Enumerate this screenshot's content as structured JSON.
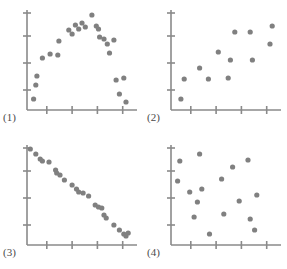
{
  "figure": {
    "width": 287,
    "height": 269,
    "background_color": "#ffffff",
    "axis_color": "#8a8a8a",
    "point_color": "#808080",
    "label_color": "#4a4a4a",
    "point_radius": 2.6
  },
  "chart_data": [
    {
      "type": "scatter",
      "title": "(1)",
      "panel_index": 1,
      "pattern": "curvilinear (inverted U)",
      "xlabel": "",
      "ylabel": "",
      "xlim": [
        0,
        100
      ],
      "ylim": [
        0,
        100
      ],
      "grid": false,
      "legend": "none",
      "x_ticks": [
        18,
        41,
        64,
        87
      ],
      "y_ticks": [
        20,
        47,
        74,
        97
      ],
      "x_tick_labels": [
        "",
        "",
        "",
        ""
      ],
      "y_tick_labels": [
        "",
        "",
        "",
        ""
      ],
      "points": [
        {
          "x": 6,
          "y": 11
        },
        {
          "x": 8,
          "y": 25
        },
        {
          "x": 9,
          "y": 34
        },
        {
          "x": 14,
          "y": 52
        },
        {
          "x": 21,
          "y": 56
        },
        {
          "x": 28,
          "y": 55
        },
        {
          "x": 29,
          "y": 69
        },
        {
          "x": 38,
          "y": 80
        },
        {
          "x": 41,
          "y": 76
        },
        {
          "x": 44,
          "y": 85
        },
        {
          "x": 47,
          "y": 81
        },
        {
          "x": 50,
          "y": 87
        },
        {
          "x": 53,
          "y": 83
        },
        {
          "x": 59,
          "y": 95
        },
        {
          "x": 63,
          "y": 84
        },
        {
          "x": 65,
          "y": 81
        },
        {
          "x": 66,
          "y": 73
        },
        {
          "x": 70,
          "y": 71
        },
        {
          "x": 73,
          "y": 66
        },
        {
          "x": 75,
          "y": 57
        },
        {
          "x": 79,
          "y": 70
        },
        {
          "x": 81,
          "y": 30
        },
        {
          "x": 84,
          "y": 16
        },
        {
          "x": 88,
          "y": 32
        },
        {
          "x": 90,
          "y": 8
        }
      ]
    },
    {
      "type": "scatter",
      "title": "(2)",
      "panel_index": 2,
      "pattern": "positive correlation",
      "xlabel": "",
      "ylabel": "",
      "xlim": [
        0,
        100
      ],
      "ylim": [
        0,
        100
      ],
      "grid": false,
      "legend": "none",
      "x_ticks": [
        18,
        41,
        64,
        87
      ],
      "y_ticks": [
        20,
        47,
        74,
        97
      ],
      "x_tick_labels": [
        "",
        "",
        "",
        ""
      ],
      "y_tick_labels": [
        "",
        "",
        "",
        ""
      ],
      "points": [
        {
          "x": 9,
          "y": 11
        },
        {
          "x": 12,
          "y": 31
        },
        {
          "x": 26,
          "y": 42
        },
        {
          "x": 34,
          "y": 31
        },
        {
          "x": 43,
          "y": 58
        },
        {
          "x": 52,
          "y": 32
        },
        {
          "x": 54,
          "y": 50
        },
        {
          "x": 58,
          "y": 78
        },
        {
          "x": 72,
          "y": 78
        },
        {
          "x": 74,
          "y": 50
        },
        {
          "x": 90,
          "y": 66
        },
        {
          "x": 92,
          "y": 84
        }
      ]
    },
    {
      "type": "scatter",
      "title": "(3)",
      "panel_index": 3,
      "pattern": "strong negative correlation",
      "xlabel": "",
      "ylabel": "",
      "xlim": [
        0,
        100
      ],
      "ylim": [
        0,
        100
      ],
      "grid": false,
      "legend": "none",
      "x_ticks": [
        18,
        41,
        64,
        87
      ],
      "y_ticks": [
        20,
        47,
        74,
        97
      ],
      "x_tick_labels": [
        "",
        "",
        "",
        ""
      ],
      "y_tick_labels": [
        "",
        "",
        "",
        ""
      ],
      "points": [
        {
          "x": 3,
          "y": 96
        },
        {
          "x": 8,
          "y": 91
        },
        {
          "x": 12,
          "y": 86
        },
        {
          "x": 14,
          "y": 84
        },
        {
          "x": 20,
          "y": 83
        },
        {
          "x": 26,
          "y": 75
        },
        {
          "x": 27,
          "y": 72
        },
        {
          "x": 30,
          "y": 70
        },
        {
          "x": 34,
          "y": 65
        },
        {
          "x": 41,
          "y": 60
        },
        {
          "x": 45,
          "y": 56
        },
        {
          "x": 47,
          "y": 53
        },
        {
          "x": 51,
          "y": 52
        },
        {
          "x": 56,
          "y": 49
        },
        {
          "x": 62,
          "y": 40
        },
        {
          "x": 65,
          "y": 38
        },
        {
          "x": 68,
          "y": 37
        },
        {
          "x": 70,
          "y": 30
        },
        {
          "x": 72,
          "y": 27
        },
        {
          "x": 79,
          "y": 20
        },
        {
          "x": 84,
          "y": 15
        },
        {
          "x": 88,
          "y": 11
        },
        {
          "x": 90,
          "y": 9
        },
        {
          "x": 92,
          "y": 12
        }
      ]
    },
    {
      "type": "scatter",
      "title": "(4)",
      "panel_index": 4,
      "pattern": "no correlation",
      "xlabel": "",
      "ylabel": "",
      "xlim": [
        0,
        100
      ],
      "ylim": [
        0,
        100
      ],
      "grid": false,
      "legend": "none",
      "x_ticks": [
        18,
        41,
        64,
        87
      ],
      "y_ticks": [
        20,
        47,
        74,
        97
      ],
      "x_tick_labels": [
        "",
        "",
        "",
        ""
      ],
      "y_tick_labels": [
        "",
        "",
        "",
        ""
      ],
      "points": [
        {
          "x": 8,
          "y": 84
        },
        {
          "x": 6,
          "y": 64
        },
        {
          "x": 17,
          "y": 53
        },
        {
          "x": 26,
          "y": 91
        },
        {
          "x": 28,
          "y": 56
        },
        {
          "x": 24,
          "y": 43
        },
        {
          "x": 21,
          "y": 28
        },
        {
          "x": 35,
          "y": 11
        },
        {
          "x": 46,
          "y": 66
        },
        {
          "x": 48,
          "y": 31
        },
        {
          "x": 56,
          "y": 78
        },
        {
          "x": 62,
          "y": 44
        },
        {
          "x": 70,
          "y": 85
        },
        {
          "x": 72,
          "y": 26
        },
        {
          "x": 78,
          "y": 50
        },
        {
          "x": 76,
          "y": 15
        }
      ]
    }
  ]
}
